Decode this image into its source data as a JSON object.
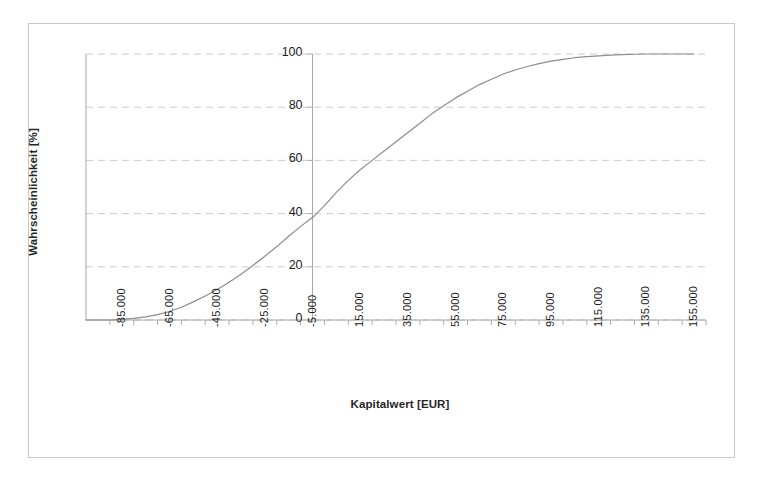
{
  "chart_data": {
    "type": "line",
    "title": "",
    "subtitle": "",
    "xlabel": "Kapitalwert [EUR]",
    "ylabel": "Wahrscheinlichkeit [%]",
    "xlim": [
      -95000,
      165000
    ],
    "ylim": [
      0,
      100
    ],
    "grid": "horizontal-dashed",
    "legend": "none",
    "x_tick_labels": [
      "-85.000",
      "-65.000",
      "-45.000",
      "-25.000",
      "-5.000",
      "15.000",
      "35.000",
      "55.000",
      "75.000",
      "95.000",
      "115.000",
      "135.000",
      "155.000"
    ],
    "x_tick_values": [
      -85000,
      -65000,
      -45000,
      -25000,
      -5000,
      15000,
      35000,
      55000,
      75000,
      95000,
      115000,
      135000,
      155000
    ],
    "x_minor_step": 10000,
    "y_tick_labels": [
      "0",
      "20",
      "40",
      "60",
      "80",
      "100"
    ],
    "y_tick_values": [
      0,
      20,
      40,
      60,
      80,
      100
    ],
    "series": [
      {
        "name": "Kumulierte Wahrscheinlichkeit",
        "color": "#8c8c8c",
        "x": [
          -95000,
          -85000,
          -80000,
          -75000,
          -70000,
          -65000,
          -60000,
          -55000,
          -50000,
          -45000,
          -40000,
          -35000,
          -30000,
          -25000,
          -20000,
          -15000,
          -10000,
          -5000,
          0,
          5000,
          10000,
          15000,
          20000,
          25000,
          30000,
          35000,
          40000,
          45000,
          50000,
          55000,
          60000,
          65000,
          70000,
          75000,
          80000,
          85000,
          90000,
          95000,
          100000,
          105000,
          110000,
          115000,
          120000,
          125000,
          130000,
          135000,
          140000,
          145000,
          150000,
          155000,
          160000
        ],
        "y": [
          0.0,
          0.0,
          0.2,
          0.6,
          1.2,
          2.0,
          3.2,
          4.8,
          6.8,
          9.0,
          11.5,
          14.2,
          17.2,
          20.5,
          24.0,
          27.6,
          31.5,
          35.2,
          38.5,
          43.0,
          48.0,
          52.5,
          56.5,
          60.0,
          63.5,
          67.0,
          70.5,
          74.0,
          77.5,
          80.5,
          83.5,
          86.0,
          88.5,
          90.5,
          92.5,
          94.0,
          95.3,
          96.4,
          97.3,
          98.0,
          98.6,
          99.0,
          99.3,
          99.6,
          99.8,
          99.9,
          100.0,
          100.0,
          100.0,
          100.0,
          100.0
        ]
      }
    ],
    "annotations": []
  },
  "axes": {
    "x_title": "Kapitalwert [EUR]",
    "y_title": "Wahrscheinlichkeit [%]"
  },
  "style": {
    "curve_color": "#8c8c8c",
    "grid_color": "#b9b9c9",
    "axis_color": "#a8a8a8",
    "frame_color": "#c9c9c9",
    "text_color": "#1c1c1c",
    "background": "#ffffff"
  }
}
